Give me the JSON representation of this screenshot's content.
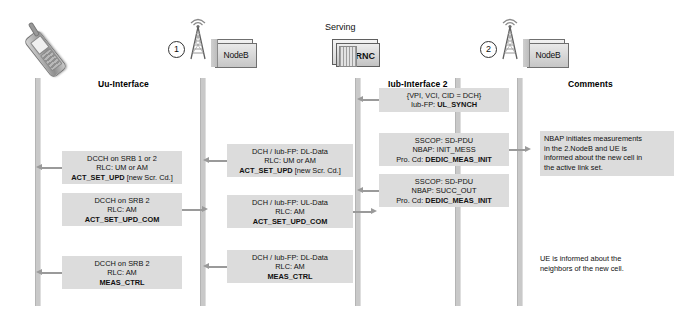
{
  "diagram": {
    "type": "uml-sequence-diagram"
  },
  "actors": [
    {
      "id": "ue",
      "label": "",
      "icon": "mobile-phone-icon",
      "marker": ""
    },
    {
      "id": "nodeb1",
      "label": "NodeB",
      "icon": "antenna-tower-icon",
      "marker": "1"
    },
    {
      "id": "rnc",
      "label": "RNC",
      "icon": "rnc-server-icon",
      "marker": "",
      "caption": "Serving"
    },
    {
      "id": "nodeb2",
      "label": "NodeB",
      "icon": "antenna-tower-icon",
      "marker": "2"
    }
  ],
  "columns": [
    {
      "id": "uu",
      "header": "Uu-Interface"
    },
    {
      "id": "iub",
      "header": "Iub-Interface 2"
    },
    {
      "id": "com",
      "header": "Comments"
    }
  ],
  "messages": [
    {
      "id": "uu-act-set-upd",
      "column": "uu",
      "direction": "left",
      "line1": "DCCH on SRB 1 or 2",
      "line2": "RLC: UM or AM",
      "line3_bold": "ACT_SET_UPD",
      "line3_rest": " [new Scr. Cd.]"
    },
    {
      "id": "uu-act-set-upd-com",
      "column": "uu",
      "direction": "right",
      "line1": "DCCH on SRB 2",
      "line2": "RLC: AM",
      "line3_bold": "ACT_SET_UPD_COM",
      "line3_rest": ""
    },
    {
      "id": "uu-meas-ctrl",
      "column": "uu",
      "direction": "left",
      "line1": "DCCH on SRB 2",
      "line2": "RLC: AM",
      "line3_bold": "MEAS_CTRL",
      "line3_rest": ""
    },
    {
      "id": "iub1-act-set-upd",
      "column": "iub1",
      "direction": "left",
      "line1": "DCH / Iub-FP: DL-Data",
      "line2": "RLC: UM or AM",
      "line3_bold": "ACT_SET_UPD",
      "line3_rest": " [new Scr. Cd.]"
    },
    {
      "id": "iub1-act-set-upd-com",
      "column": "iub1",
      "direction": "right",
      "line1": "DCH / Iub-FP: UL-Data",
      "line2": "RLC: AM",
      "line3_bold": "ACT_SET_UPD_COM",
      "line3_rest": ""
    },
    {
      "id": "iub1-meas-ctrl",
      "column": "iub1",
      "direction": "left",
      "line1": "DCH / Iub-FP: DL-Data",
      "line2": "RLC: AM",
      "line3_bold": "MEAS_CTRL",
      "line3_rest": ""
    },
    {
      "id": "iub2-ul-synch",
      "column": "iub",
      "direction": "left",
      "line1": "{VPI, VCI, CID = DCH}",
      "line2_prefix": "Iub-FP: ",
      "line2_bold": "UL_SYNCH"
    },
    {
      "id": "iub2-init-mess",
      "column": "iub",
      "direction": "right",
      "line1": "SSCOP: SD-PDU",
      "line2": "NBAP: INIT_MESS",
      "line3_prefix": "Pro. Cd: ",
      "line3_bold": "DEDIC_MEAS_INIT"
    },
    {
      "id": "iub2-succ-out",
      "column": "iub",
      "direction": "left",
      "line1": "SSCOP: SD-PDU",
      "line2": "NBAP: SUCC_OUT",
      "line3_prefix": "Pro. Cd: ",
      "line3_bold": "DEDIC_MEAS_INIT"
    }
  ],
  "comments": [
    {
      "id": "comment-nbap",
      "line1": "NBAP initiates measurements",
      "line2": "in the 2.NodeB and UE is",
      "line3": "informed about the new cell in",
      "line4": "the active link set."
    },
    {
      "id": "comment-neighbors",
      "line1": "UE is informed about the",
      "line2": "neighbors of the new cell."
    }
  ],
  "colors": {
    "box_fill": "#dcdcdc",
    "lifeline": "#c9c9c9",
    "arrow": "#9a9a9a",
    "text": "#111111",
    "background": "#ffffff"
  }
}
